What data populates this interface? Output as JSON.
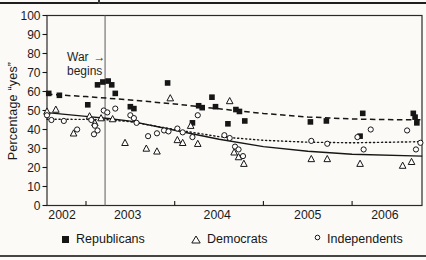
{
  "page": {
    "background": "#fbfaf7",
    "rules": {
      "top_color": "#1e1e1e",
      "bottom_color": "#454545"
    }
  },
  "chart_data": {
    "type": "scatter",
    "title": "",
    "ylabel": "Percentage “yes”",
    "xlabel": "",
    "ylim": [
      0,
      100
    ],
    "xlim": [
      2002.56,
      2006.79
    ],
    "grid": false,
    "legend_position": "bottom",
    "y_ticks": [
      0,
      10,
      20,
      30,
      40,
      50,
      60,
      70,
      80,
      90,
      100
    ],
    "x_axis": {
      "tick_years": [
        2003,
        2004,
        2005,
        2006
      ],
      "labels": [
        {
          "text": "2002",
          "year_pos": 2002.73
        },
        {
          "text": "2003",
          "year_pos": 2003.47
        },
        {
          "text": "2004",
          "year_pos": 2004.48
        },
        {
          "text": "2005",
          "year_pos": 2005.5
        },
        {
          "text": "2006",
          "year_pos": 2006.37
        }
      ]
    },
    "war_annotation": {
      "line1": "War",
      "line2": "begins",
      "arrow": "→",
      "year": 2003.215
    },
    "colors": {
      "ink": "#161616",
      "war_line": "#6a6a6a",
      "frame": "#2a2a2a"
    },
    "series": [
      {
        "name": "Republicans",
        "marker": "square-filled",
        "trend_style": "dashed",
        "points": [
          [
            2002.58,
            59
          ],
          [
            2002.7,
            58
          ],
          [
            2003.02,
            53
          ],
          [
            2003.13,
            63.5
          ],
          [
            2003.19,
            65
          ],
          [
            2003.25,
            65.5
          ],
          [
            2003.29,
            63.5
          ],
          [
            2003.33,
            59
          ],
          [
            2003.5,
            52
          ],
          [
            2003.54,
            51
          ],
          [
            2003.92,
            64.5
          ],
          [
            2004.2,
            43.5
          ],
          [
            2004.27,
            52.5
          ],
          [
            2004.31,
            51.5
          ],
          [
            2004.42,
            57
          ],
          [
            2004.46,
            52
          ],
          [
            2004.6,
            43
          ],
          [
            2004.69,
            50.5
          ],
          [
            2004.73,
            49.5
          ],
          [
            2004.79,
            44.5
          ],
          [
            2005.53,
            44
          ],
          [
            2005.71,
            44.5
          ],
          [
            2006.09,
            36.5
          ],
          [
            2006.12,
            48.5
          ],
          [
            2006.69,
            48.5
          ],
          [
            2006.71,
            46.5
          ],
          [
            2006.73,
            43.5
          ]
        ],
        "trend": [
          [
            2002.56,
            58.6
          ],
          [
            2003.0,
            57.3
          ],
          [
            2003.5,
            55.6
          ],
          [
            2004.0,
            53.4
          ],
          [
            2004.5,
            50.9
          ],
          [
            2005.0,
            48.4
          ],
          [
            2005.5,
            46.6
          ],
          [
            2006.0,
            45.5
          ],
          [
            2006.4,
            45.2
          ],
          [
            2006.79,
            45.1
          ]
        ]
      },
      {
        "name": "Democrats",
        "marker": "triangle-open",
        "trend_style": "solid",
        "points": [
          [
            2002.56,
            49.5
          ],
          [
            2002.66,
            50.5
          ],
          [
            2002.86,
            38
          ],
          [
            2003.04,
            47
          ],
          [
            2003.1,
            43.5
          ],
          [
            2003.17,
            46
          ],
          [
            2003.3,
            45.5
          ],
          [
            2003.44,
            33
          ],
          [
            2003.68,
            30
          ],
          [
            2003.8,
            28.5
          ],
          [
            2003.95,
            56.5
          ],
          [
            2004.03,
            34.5
          ],
          [
            2004.09,
            33
          ],
          [
            2004.18,
            42
          ],
          [
            2004.26,
            32.5
          ],
          [
            2004.62,
            55
          ],
          [
            2004.67,
            28
          ],
          [
            2004.72,
            25.5
          ],
          [
            2004.78,
            22
          ],
          [
            2005.54,
            24.5
          ],
          [
            2005.72,
            24.5
          ],
          [
            2006.09,
            22
          ],
          [
            2006.57,
            21
          ],
          [
            2006.67,
            23
          ]
        ],
        "trend": [
          [
            2002.56,
            48.9
          ],
          [
            2003.0,
            46.9
          ],
          [
            2003.25,
            45.8
          ],
          [
            2003.5,
            44.4
          ],
          [
            2004.0,
            39.6
          ],
          [
            2004.5,
            34.9
          ],
          [
            2005.0,
            31.0
          ],
          [
            2005.5,
            28.6
          ],
          [
            2006.0,
            27.0
          ],
          [
            2006.79,
            26.0
          ]
        ]
      },
      {
        "name": "Independents",
        "marker": "circle-open",
        "trend_style": "dotted",
        "points": [
          [
            2002.56,
            47.5
          ],
          [
            2002.61,
            45
          ],
          [
            2002.75,
            44.5
          ],
          [
            2002.9,
            40
          ],
          [
            2003.06,
            45
          ],
          [
            2003.09,
            37.5
          ],
          [
            2003.1,
            42
          ],
          [
            2003.13,
            39.5
          ],
          [
            2003.2,
            50
          ],
          [
            2003.24,
            49
          ],
          [
            2003.33,
            51
          ],
          [
            2003.5,
            47.5
          ],
          [
            2003.54,
            46
          ],
          [
            2003.57,
            43.5
          ],
          [
            2003.7,
            36.5
          ],
          [
            2003.8,
            38
          ],
          [
            2003.88,
            39.5
          ],
          [
            2003.93,
            39
          ],
          [
            2004.03,
            40.5
          ],
          [
            2004.09,
            38.5
          ],
          [
            2004.2,
            36
          ],
          [
            2004.26,
            47.5
          ],
          [
            2004.56,
            37
          ],
          [
            2004.62,
            35.5
          ],
          [
            2004.68,
            31
          ],
          [
            2004.72,
            29.5
          ],
          [
            2004.77,
            26
          ],
          [
            2005.54,
            34
          ],
          [
            2005.72,
            32.5
          ],
          [
            2006.06,
            36
          ],
          [
            2006.13,
            29.5
          ],
          [
            2006.21,
            40
          ],
          [
            2006.62,
            39.5
          ],
          [
            2006.72,
            29.5
          ],
          [
            2006.77,
            33
          ]
        ],
        "trend": [
          [
            2002.56,
            45.4
          ],
          [
            2003.0,
            45.3
          ],
          [
            2003.25,
            45.1
          ],
          [
            2003.5,
            44.1
          ],
          [
            2004.0,
            40.0
          ],
          [
            2004.5,
            36.2
          ],
          [
            2005.0,
            34.3
          ],
          [
            2005.5,
            33.3
          ],
          [
            2006.0,
            33.0
          ],
          [
            2006.79,
            33.6
          ]
        ]
      }
    ]
  }
}
